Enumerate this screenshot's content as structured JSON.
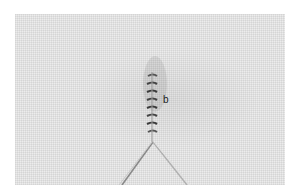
{
  "image": {
    "subject": "embroidery thread wrapped around needle on linen fabric",
    "label": "b"
  }
}
